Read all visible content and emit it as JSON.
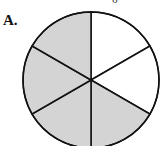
{
  "option_label": "A.",
  "top_fragment": "6",
  "diagram": {
    "type": "fraction-circle",
    "total_sectors": 6,
    "shaded_sectors": 4,
    "shaded_color": "#d4d4d4",
    "unshaded_color": "#ffffff",
    "stroke_color": "#111111"
  }
}
